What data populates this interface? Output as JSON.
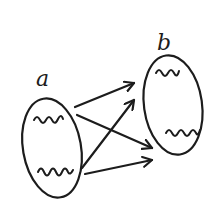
{
  "diagram": {
    "type": "set-mapping",
    "style": "hand-drawn",
    "stroke_color": "#1c1c1c",
    "background": "#ffffff",
    "sets": [
      {
        "id": "a",
        "label": "a",
        "label_pos": [
          36,
          86
        ],
        "ellipse": {
          "cx": 52,
          "cy": 148,
          "rx": 29,
          "ry": 50,
          "rotate": -10
        },
        "elements": [
          {
            "id": "a1",
            "glyph": "squiggle-2",
            "path": "M 34 120 q 3 -6 6 0 q 3 6 6 0 q 3 -6 6 0 q 3 6 6 -1 q 3 -6 5 0"
          },
          {
            "id": "a2",
            "glyph": "squiggle-3",
            "path": "M 38 172 q 3 -7 6 0 q 3 7 6 0 q 3 -7 6 0 q 3 7 6 0 q 3 -7 6 0 q 2 4 5 -2"
          }
        ]
      },
      {
        "id": "b",
        "label": "b",
        "label_pos": [
          157,
          50
        ],
        "ellipse": {
          "cx": 173,
          "cy": 105,
          "rx": 29,
          "ry": 50,
          "rotate": -8
        },
        "elements": [
          {
            "id": "b1",
            "glyph": "squiggle-2",
            "path": "M 156 73 q 3 -6 6 0 q 3 6 6 0 q 3 -6 6 0 q 3 6 5 -2"
          },
          {
            "id": "b2",
            "glyph": "squiggle-3",
            "path": "M 166 133 q 3 -6 6 0 q 3 6 6 0 q 3 -6 6 0 q 3 6 6 0 q 3 -6 6 0 q 2 4 4 -3"
          }
        ]
      }
    ],
    "arrows": [
      {
        "from": "a1",
        "to": "b1",
        "x1": 75,
        "y1": 107,
        "x2": 134,
        "y2": 83
      },
      {
        "from": "a1",
        "to": "b2",
        "x1": 77,
        "y1": 115,
        "x2": 152,
        "y2": 148
      },
      {
        "from": "a2",
        "to": "b1",
        "x1": 82,
        "y1": 168,
        "x2": 134,
        "y2": 100
      },
      {
        "from": "a2",
        "to": "b2",
        "x1": 85,
        "y1": 174,
        "x2": 152,
        "y2": 160
      }
    ]
  }
}
